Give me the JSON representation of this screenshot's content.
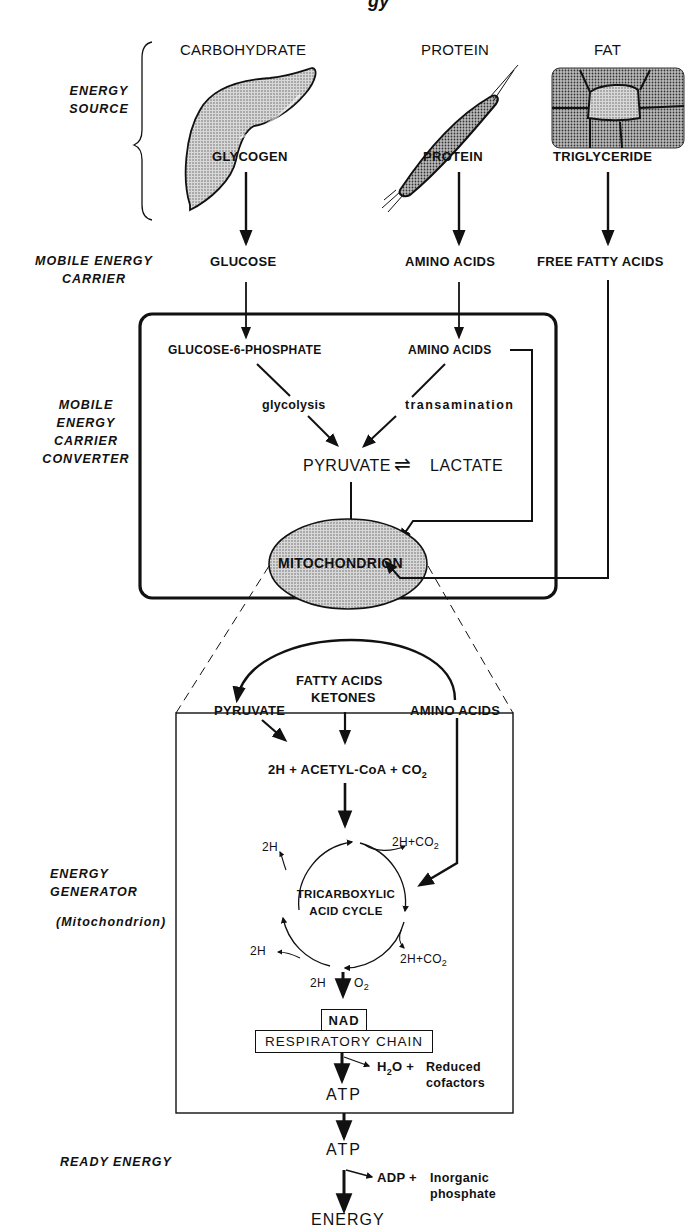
{
  "diagram": {
    "title_fragment": "gy",
    "stages": {
      "energy_source": "ENERGY SOURCE",
      "mobile_energy_carrier": "MOBILE ENERGY CARRIER",
      "converter": [
        "MOBILE",
        "ENERGY",
        "CARRIER",
        "CONVERTER"
      ],
      "generator": [
        "ENERGY",
        "GENERATOR"
      ],
      "generator_note": "(Mitochondrion)",
      "ready_energy": "READY ENERGY"
    },
    "sources": [
      {
        "name": "CARBOHYDRATE",
        "illustration": "liver",
        "store": "GLYCOGEN",
        "carrier": "GLUCOSE"
      },
      {
        "name": "PROTEIN",
        "illustration": "muscle",
        "store": "PROTEIN",
        "carrier": "AMINO ACIDS"
      },
      {
        "name": "FAT",
        "illustration": "adipose-tissue",
        "store": "TRIGLYCERIDE",
        "carrier": "FREE FATTY ACIDS"
      }
    ],
    "converter_box": {
      "glucose6p": "GLUCOSE-6-PHOSPHATE",
      "amino_acids": "AMINO ACIDS",
      "glycolysis": "glycolysis",
      "transamination": "transamination",
      "pyruvate": "PYRUVATE",
      "equilibrium": "⇌",
      "lactate": "LACTATE",
      "mitochondrion": "MITOCHONDRION"
    },
    "generator_box": {
      "pyruvate": "PYRUVATE",
      "fatty_acids": "FATTY ACIDS",
      "ketones": "KETONES",
      "amino_acids": "AMINO ACIDS",
      "acetyl_coa_pre": "2H + ACETYL-CoA + CO",
      "acetyl_coa_sub": "2",
      "tca_line1": "TRICARBOXYLIC",
      "tca_line2": "ACID CYCLE",
      "h_top_left": "2H",
      "h_co2_top_right": "2H+CO",
      "h_co2_top_right_sub": "2",
      "h_bottom_left": "2H",
      "h_co2_bottom_right": "2H+CO",
      "h_co2_bottom_right_sub": "2",
      "h_bottom": "2H",
      "o2": "O",
      "o2_sub": "2",
      "nad": "NAD",
      "respiratory_chain": "RESPIRATORY CHAIN",
      "h2o_pre": "H",
      "h2o_sub": "2",
      "h2o_post": "O +",
      "reduced_line1": "Reduced",
      "reduced_line2": "cofactors",
      "atp": "ATP"
    },
    "ready": {
      "atp": "ATP",
      "adp": "ADP +",
      "inorganic_line1": "Inorganic",
      "inorganic_line2": "phosphate",
      "energy": "ENERGY"
    }
  }
}
